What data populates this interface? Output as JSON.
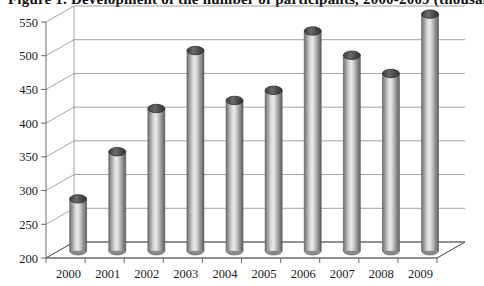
{
  "title": "Figure 1. Development of the number of participants, 2000-2009 (thousands)",
  "chart_data": {
    "type": "bar",
    "title": "Figure 1. Development of the number of participants, 2000-2009 (thousands)",
    "xlabel": "",
    "ylabel": "",
    "ylim": [
      200,
      550
    ],
    "ytick_step": 50,
    "yticks": [
      200,
      250,
      300,
      350,
      400,
      450,
      500,
      550
    ],
    "ytick_labels": [
      "200",
      "250",
      "300",
      "350",
      "400",
      "450",
      "500",
      "550"
    ],
    "categories": [
      "2000",
      "2001",
      "2002",
      "2003",
      "2004",
      "2005",
      "2006",
      "2007",
      "2008",
      "2009"
    ],
    "values": [
      277,
      347,
      411,
      497,
      423,
      438,
      526,
      490,
      463,
      551
    ],
    "grid": true,
    "legend": false,
    "style": "3d-cylinder",
    "bar_color": "#9e9e9e",
    "bar_cap_color": "#4f4f4f",
    "gridline_color": "#8a8a8a",
    "axis_color": "#6a6a6a",
    "background": "#ffffff"
  }
}
